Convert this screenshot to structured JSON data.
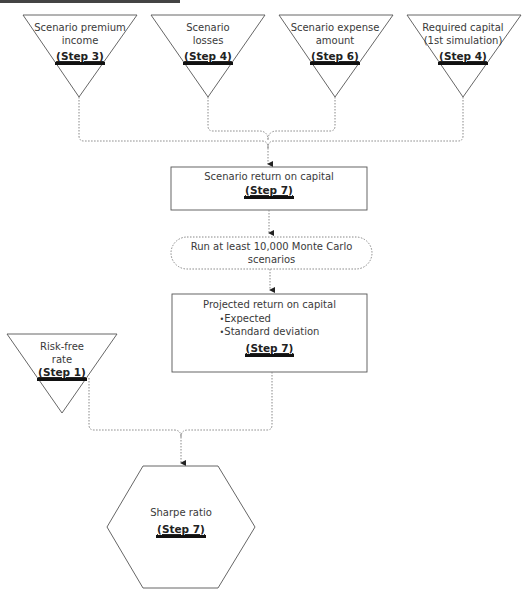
{
  "diagram": {
    "inputs": [
      {
        "label": "Scenario premium income",
        "label_lines": [
          "Scenario premium",
          "income"
        ],
        "step": "(Step 3)"
      },
      {
        "label": "Scenario losses",
        "label_lines": [
          "Scenario",
          "losses"
        ],
        "step": "(Step 4)"
      },
      {
        "label": "Scenario expense amount",
        "label_lines": [
          "Scenario expense",
          "amount"
        ],
        "step": "(Step 6)"
      },
      {
        "label": "Required capital (1st simulation)",
        "label_lines": [
          "Required capital",
          "(1st simulation)"
        ],
        "step": "(Step 4)"
      }
    ],
    "scenario_roc": {
      "title": "Scenario return on capital",
      "step": "(Step 7)"
    },
    "monte_carlo": {
      "lines": [
        "Run at least 10,000 Monte Carlo",
        "scenarios"
      ]
    },
    "projected_roc": {
      "title": "Projected return on capital",
      "bullets": [
        "Expected",
        "Standard deviation"
      ],
      "step": "(Step 7)"
    },
    "risk_free": {
      "label_lines": [
        "Risk-free",
        "rate"
      ],
      "step": "(Step 1)"
    },
    "sharpe": {
      "title": "Sharpe ratio",
      "step": "(Step 7)"
    }
  },
  "colors": {
    "stroke": "#555555",
    "connector": "#888888",
    "text": "#3a3a3a",
    "step_bar": "#111111"
  }
}
